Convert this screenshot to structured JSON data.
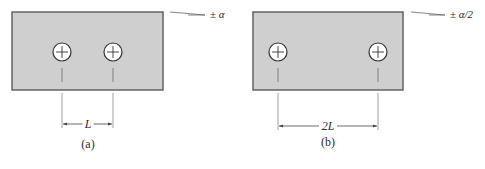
{
  "figure": {
    "panels": [
      {
        "id": "a",
        "caption": "(a)",
        "dimension_label": "L",
        "tolerance_label": "± α",
        "rect": {
          "x": 12,
          "y": 12,
          "w": 151,
          "h": 78
        },
        "holes": [
          {
            "cx": 62,
            "cy": 52
          },
          {
            "cx": 113,
            "cy": 52
          }
        ],
        "dimension": {
          "x1": 62,
          "x2": 113,
          "y": 124
        },
        "tol_line": {
          "x1": 170,
          "y1": 12,
          "x2": 205,
          "y2": 15
        },
        "tol_text": {
          "x": 210,
          "y": 18
        },
        "dim_text": {
          "x": 88,
          "y": 128
        },
        "caption_pos": {
          "x": 88,
          "y": 148
        }
      },
      {
        "id": "b",
        "caption": "(b)",
        "dimension_label": "2L",
        "tolerance_label": "± α/2",
        "rect": {
          "x": 253,
          "y": 12,
          "w": 150,
          "h": 78
        },
        "holes": [
          {
            "cx": 278,
            "cy": 52
          },
          {
            "cx": 378,
            "cy": 52
          }
        ],
        "dimension": {
          "x1": 278,
          "x2": 378,
          "y": 126
        },
        "tol_line": {
          "x1": 411,
          "y1": 12,
          "x2": 445,
          "y2": 15
        },
        "tol_text": {
          "x": 450,
          "y": 18
        },
        "dim_text": {
          "x": 328,
          "y": 130
        },
        "caption_pos": {
          "x": 328,
          "y": 146
        }
      }
    ],
    "colors": {
      "plate_fill": "#cfcfcf",
      "plate_stroke": "#5a5a5a",
      "hole_fill": "#ffffff",
      "line": "#555555",
      "text": "#2a2a2a"
    }
  }
}
